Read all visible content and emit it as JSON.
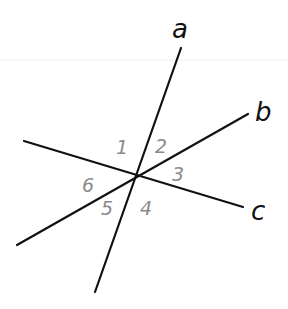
{
  "diagram": {
    "colors": {
      "line": "#111111",
      "line_label": "#111111",
      "angle_label": "#8a8a8a",
      "background": "#ffffff"
    },
    "intersection": {
      "x": 135,
      "y": 175
    },
    "lines": [
      {
        "name": "a",
        "label": "a",
        "x1": 181,
        "y1": 48,
        "x2": 95,
        "y2": 292,
        "label_x": 172,
        "label_y": 38
      },
      {
        "name": "b",
        "label": "b",
        "x1": 248,
        "y1": 114,
        "x2": 17,
        "y2": 245,
        "label_x": 255,
        "label_y": 121
      },
      {
        "name": "c",
        "label": "c",
        "x1": 24,
        "y1": 141,
        "x2": 243,
        "y2": 207,
        "label_x": 251,
        "label_y": 220
      }
    ],
    "angles": [
      {
        "label": "1",
        "x": 116,
        "y": 154
      },
      {
        "label": "2",
        "x": 155,
        "y": 153
      },
      {
        "label": "3",
        "x": 172,
        "y": 181
      },
      {
        "label": "4",
        "x": 140,
        "y": 215
      },
      {
        "label": "5",
        "x": 101,
        "y": 215
      },
      {
        "label": "6",
        "x": 82,
        "y": 192
      }
    ]
  }
}
